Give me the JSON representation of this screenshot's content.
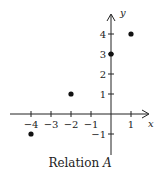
{
  "chart_data": {
    "type": "scatter",
    "title": "Relation A",
    "xlabel": "x",
    "ylabel": "y",
    "xlim": [
      -5,
      2
    ],
    "ylim": [
      -2,
      5
    ],
    "grid": false,
    "x_ticks": [
      -4,
      -3,
      -2,
      -1,
      1
    ],
    "y_ticks": [
      -1,
      1,
      2,
      3,
      4
    ],
    "points": [
      {
        "x": -4,
        "y": -1
      },
      {
        "x": -2,
        "y": 1
      },
      {
        "x": 0,
        "y": 3
      },
      {
        "x": 1,
        "y": 4
      }
    ],
    "colors": {
      "axis": "#222222",
      "point": "#111111"
    }
  },
  "caption": {
    "text": "Relation ",
    "variable": "A"
  },
  "axes": {
    "x_label": "x",
    "y_label": "y"
  }
}
